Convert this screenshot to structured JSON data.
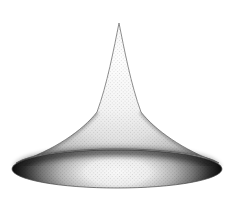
{
  "figure": {
    "type": "3d-surface-illustration",
    "background": "#ffffff"
  },
  "colors": {
    "bell": {
      "c0": "#ffffff",
      "c1": "#f5f5f5",
      "c2": "#e3e3e3",
      "c3": "#c2c2c2",
      "c4": "#9a9a9a",
      "c5": "#828282",
      "outline": "#828282",
      "edge_shade": "#555555"
    },
    "brim": {
      "c0": "#fafafa",
      "c1": "#efefef",
      "c2": "#b2b2b2",
      "c3": "#757575",
      "c4": "#2e2e2e",
      "c5": "#0a0a0a",
      "outline": "#4a4a4a"
    },
    "junction_shadow": "#1c1c1c",
    "spike": "#3c3c3c",
    "halftone": "#000000"
  }
}
